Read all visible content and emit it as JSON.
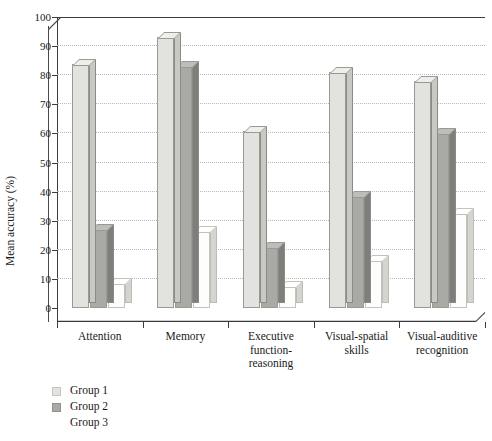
{
  "chart_data": {
    "type": "bar",
    "title": "",
    "subtitle": "",
    "xlabel": "",
    "ylabel": "Mean accuracy (%)",
    "ylim": [
      0,
      100
    ],
    "ytick_step": 10,
    "yticks": [
      0,
      10,
      20,
      30,
      40,
      50,
      60,
      70,
      80,
      90,
      100
    ],
    "grid": true,
    "grid_style": "dotted horizontal",
    "legend_position": "bottom-left",
    "style": "3D grouped column chart",
    "categories": [
      "Attention",
      "Executive function-\nreasoning",
      "Memory",
      "Visual-spatial\nskills",
      "Visual-auditive\nrecognition"
    ],
    "categories_ordered": [
      "Attention",
      "Memory",
      "Executive function-reasoning",
      "Visual-spatial skills",
      "Visual-auditive recognition"
    ],
    "series": [
      {
        "name": "Group 1",
        "color": "#e2e2de",
        "values": [
          84,
          93,
          61,
          81,
          78
        ]
      },
      {
        "name": "Group 2",
        "color": "#a9a9a5",
        "values": [
          27,
          83,
          21,
          38.5,
          60
        ]
      },
      {
        "name": "Group 3",
        "color": "#fdfdfc",
        "values": [
          8.5,
          26.5,
          7.5,
          16.5,
          32.5
        ]
      }
    ]
  },
  "axis": {
    "y_label": "Mean accuracy (%)",
    "y_tick_labels": [
      "0",
      "10",
      "20",
      "30",
      "40",
      "50",
      "60",
      "70",
      "80",
      "90",
      "100"
    ],
    "x_tick_labels": [
      {
        "line1": "Attention",
        "line2": ""
      },
      {
        "line1": "Memory",
        "line2": ""
      },
      {
        "line1": "Executive function-",
        "line2": "reasoning"
      },
      {
        "line1": "Visual-spatial",
        "line2": "skills"
      },
      {
        "line1": "Visual-auditive",
        "line2": "recognition"
      }
    ]
  },
  "legend": {
    "items": [
      {
        "label": "Group 1",
        "color": "#e2e2de",
        "border": "#c6c6c1"
      },
      {
        "label": "Group 2",
        "color": "#a9a9a5",
        "border": "#8f8f8b"
      },
      {
        "label": "Group 3",
        "color": "#ffffff",
        "border": "#ffffff"
      }
    ]
  },
  "colors": {
    "group1_face": "#e2e2de",
    "group1_side": "#c9c9c4",
    "group1_top": "#eeeeea",
    "group2_face": "#a9a9a5",
    "group2_side": "#7e7e7a",
    "group2_top": "#bdbdb9",
    "group3_face": "#fdfdfc",
    "group3_side": "#d5d5d0",
    "group3_top": "#ffffff",
    "axis": "#3b3b3b",
    "grid": "#b9b9b9",
    "text": "#1a1a1a",
    "background": "#ffffff"
  }
}
